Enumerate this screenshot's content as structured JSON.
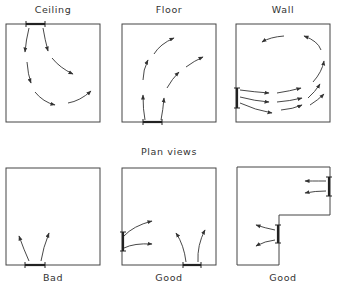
{
  "section_labels": {
    "plan_views": "Plan views"
  },
  "top_row": [
    {
      "label": "Ceiling",
      "outlet": "ceiling"
    },
    {
      "label": "Floor",
      "outlet": "floor"
    },
    {
      "label": "Wall",
      "outlet": "wall"
    }
  ],
  "bottom_row": [
    {
      "label": "Bad"
    },
    {
      "label": "Good"
    },
    {
      "label": "Good"
    }
  ],
  "colors": {
    "line": "#333333",
    "background": "#ffffff"
  }
}
